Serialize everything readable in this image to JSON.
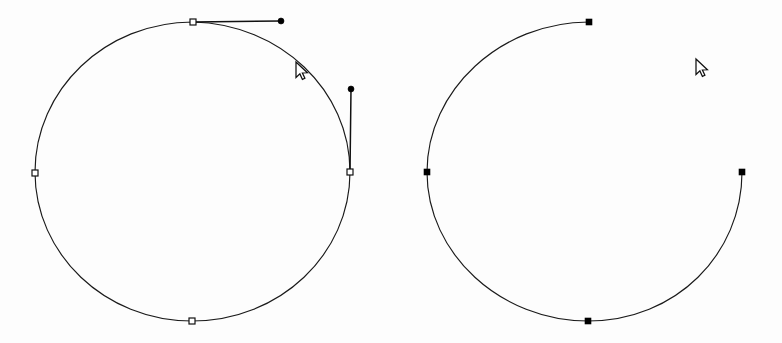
{
  "canvas": {
    "width": 782,
    "height": 343,
    "background_color": "#fdfdfd",
    "stroke_color": "#1a1a1a",
    "anchor_fill_selected": "#000000",
    "anchor_fill_unselected": "#ffffff",
    "handle_color": "#111111",
    "title": "Vector path node editing comparison"
  },
  "left_shape": {
    "name": "closed-circle-path",
    "type": "closed-ellipse",
    "center_x": 192,
    "center_y": 171,
    "radius_x": 157,
    "radius_y": 150,
    "anchor_style": "hollow-square",
    "anchor_size": 6,
    "anchors": [
      {
        "label": "top",
        "x": 193,
        "y": 22
      },
      {
        "label": "right",
        "x": 350,
        "y": 172
      },
      {
        "label": "bottom",
        "x": 192,
        "y": 321
      },
      {
        "label": "left",
        "x": 35,
        "y": 173
      }
    ],
    "handles": [
      {
        "label": "top-anchor-handle-right",
        "from_x": 193,
        "from_y": 22,
        "to_x": 281,
        "to_y": 21,
        "direction": "horizontal"
      },
      {
        "label": "right-anchor-handle-up",
        "from_x": 350,
        "from_y": 172,
        "to_x": 351,
        "to_y": 89,
        "direction": "vertical"
      }
    ],
    "handle_dot_radius": 3,
    "path_d": "M 193 22 C 280 24 350 90 350 172 C 350 254 280 321 192 321 C 105 321 35 254 35 172 C 35 90 105 22 193 22 Z"
  },
  "right_shape": {
    "name": "open-arc-path",
    "type": "open-arc",
    "center_x": 585,
    "center_y": 171,
    "radius_x": 158,
    "radius_y": 150,
    "anchor_style": "filled-square",
    "anchor_size": 6,
    "gap_description": "upper-right quadrant open between top and right anchors",
    "anchors": [
      {
        "label": "top",
        "x": 589,
        "y": 22
      },
      {
        "label": "right",
        "x": 742,
        "y": 172
      },
      {
        "label": "bottom",
        "x": 588,
        "y": 321
      },
      {
        "label": "left",
        "x": 427,
        "y": 172
      }
    ],
    "path_d": "M 589 22 C 501 22 427 90 427 172 C 427 254 501 321 588 321 C 676 321 742 254 742 172"
  },
  "cursors": [
    {
      "label": "left-panel-pointer",
      "x": 296,
      "y": 62
    },
    {
      "label": "right-panel-pointer",
      "x": 696,
      "y": 59
    }
  ]
}
